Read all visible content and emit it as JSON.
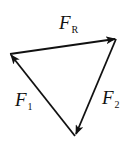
{
  "diagram": {
    "type": "vector-triangle",
    "stroke_color": "#111111",
    "vertices": {
      "left": [
        10,
        54
      ],
      "top_right": [
        116,
        39
      ],
      "bottom": [
        75,
        136
      ]
    },
    "vectors": [
      {
        "id": "FR",
        "name": "F",
        "subscript": "R",
        "from": "left",
        "to": "top_right"
      },
      {
        "id": "F2",
        "name": "F",
        "subscript": "2",
        "from": "top_right",
        "to": "bottom"
      },
      {
        "id": "F1",
        "name": "F",
        "subscript": "1",
        "from": "bottom",
        "to": "left"
      }
    ],
    "labels": {
      "fr": {
        "main": "F",
        "sub": "R"
      },
      "f1": {
        "main": "F",
        "sub": "1"
      },
      "f2": {
        "main": "F",
        "sub": "2"
      }
    }
  }
}
